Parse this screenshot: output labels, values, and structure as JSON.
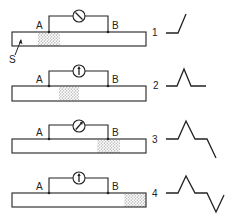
{
  "diagram": {
    "type": "galvanometer-bar-experiment",
    "colors": {
      "stroke": "#222222",
      "stipple": "#9a9a9a",
      "background": "#ffffff"
    },
    "specimen_label": "S",
    "panels": [
      {
        "number": "1",
        "label_a": "A",
        "label_b": "B",
        "meter_needle": "tilted-left-down",
        "stipple_position": "under-A",
        "waveform": "baseline then upward deflection"
      },
      {
        "number": "2",
        "label_a": "A",
        "label_b": "B",
        "meter_needle": "vertical-up",
        "stipple_position": "between-A-and-B",
        "waveform": "baseline, peak up, return to baseline"
      },
      {
        "number": "3",
        "label_a": "A",
        "label_b": "B",
        "meter_needle": "tilted-right-up",
        "stipple_position": "under-B",
        "waveform": "baseline, peak up, baseline, downward deflection"
      },
      {
        "number": "4",
        "label_a": "A",
        "label_b": "B",
        "meter_needle": "vertical-up",
        "stipple_position": "beyond-B",
        "waveform": "baseline, peak up, baseline, trough down, return"
      }
    ]
  }
}
